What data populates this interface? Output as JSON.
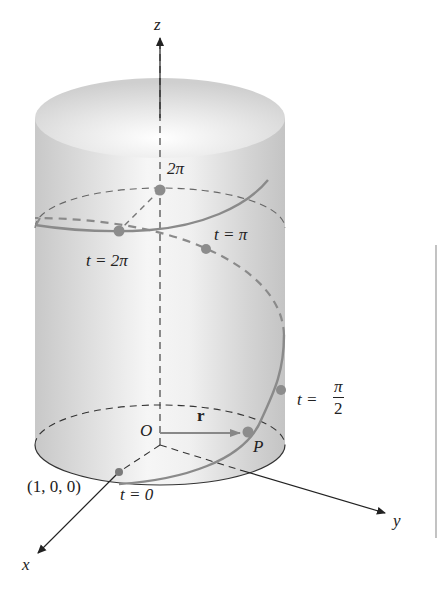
{
  "figure": {
    "type": "helix-on-cylinder",
    "axes": {
      "x": "x",
      "y": "y",
      "z": "z",
      "origin": "O"
    },
    "labels": {
      "z_height": "2π",
      "t_2pi": "t = 2π",
      "t_pi": "t = π",
      "t_half_pi_prefix": "t =",
      "t_half_pi_num": "π",
      "t_half_pi_den": "2",
      "t_zero": "t = 0",
      "start_point": "(1, 0, 0)",
      "position_vector": "r",
      "point": "P"
    },
    "colors": {
      "curve": "#8a8a8a",
      "points": "#8c8c8c",
      "axes": "#222222",
      "dashes": "#555555",
      "cylinder_light": "#f4f4f4",
      "cylinder_dark": "#c9c9c9",
      "margin_rule": "#9a9a9a"
    }
  }
}
